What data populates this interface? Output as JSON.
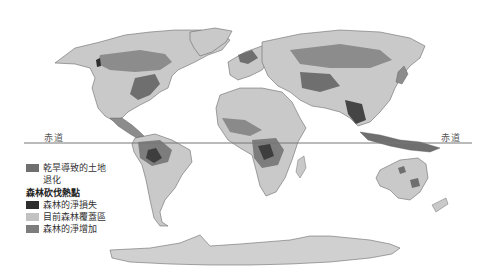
{
  "map": {
    "projection": "world",
    "colors": {
      "ocean": "#ffffff",
      "land_forest_cover": "#c9c9c9",
      "dryland_degradation": "#6f6f6f",
      "net_forest_loss": "#2e2e2e",
      "net_forest_gain": "#8c8c8c",
      "antarctica": "#d0d0d0",
      "borders": "#555555",
      "equator": "#777777"
    },
    "equator_labels": {
      "left": "赤道",
      "right": "赤道"
    }
  },
  "legend": {
    "items": [
      {
        "label_line1": "乾旱導致的土地",
        "label_line2": "退化",
        "color": "#6f6f6f"
      }
    ],
    "section_title": "森林砍伐熱點",
    "section_items": [
      {
        "label": "森林的淨損失",
        "color": "#2e2e2e"
      },
      {
        "label": "目前森林覆蓋區",
        "color": "#c2c2c2"
      },
      {
        "label": "森林的淨增加",
        "color": "#7d7d7d"
      }
    ]
  }
}
